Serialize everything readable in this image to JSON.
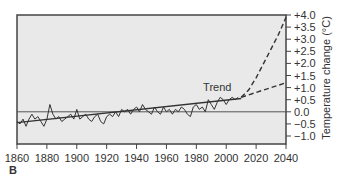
{
  "panel_label": "B",
  "chart_data": {
    "type": "line",
    "title": "",
    "xlabel": "",
    "ylabel": "Temperature change (°C)",
    "xlim": [
      1860,
      2040
    ],
    "ylim": [
      -1.0,
      4.0
    ],
    "x_ticks": [
      "1860",
      "1880",
      "1900",
      "1920",
      "1940",
      "1960",
      "1980",
      "2000",
      "2020",
      "2040"
    ],
    "y_ticks": [
      "+4.0",
      "+3.5",
      "+3.0",
      "+2.5",
      "+2.0",
      "+1.5",
      "+1.0",
      "+0.5",
      "0.0",
      "−0.5",
      "−1.0"
    ],
    "grid": false,
    "reference_line": 0.0,
    "annotations": [
      {
        "text": "Trend",
        "x": 1994,
        "y": 0.85
      }
    ],
    "series": [
      {
        "name": "Observed annual temperature anomaly",
        "style": "solid",
        "x": [
          1860,
          1862,
          1864,
          1866,
          1868,
          1870,
          1872,
          1874,
          1876,
          1878,
          1880,
          1882,
          1884,
          1886,
          1888,
          1890,
          1892,
          1894,
          1896,
          1898,
          1900,
          1902,
          1904,
          1906,
          1908,
          1910,
          1912,
          1914,
          1916,
          1918,
          1920,
          1922,
          1924,
          1926,
          1928,
          1930,
          1932,
          1934,
          1936,
          1938,
          1940,
          1942,
          1944,
          1946,
          1948,
          1950,
          1952,
          1954,
          1956,
          1958,
          1960,
          1962,
          1964,
          1966,
          1968,
          1970,
          1972,
          1974,
          1976,
          1978,
          1980,
          1982,
          1984,
          1986,
          1988,
          1990,
          1992,
          1994,
          1996,
          1998,
          2000,
          2002,
          2004,
          2006,
          2008
        ],
        "values": [
          -0.4,
          -0.5,
          -0.3,
          -0.6,
          -0.3,
          -0.1,
          -0.3,
          -0.2,
          -0.4,
          -0.6,
          -0.3,
          0.3,
          -0.1,
          -0.3,
          -0.2,
          -0.4,
          -0.3,
          -0.2,
          -0.1,
          -0.3,
          0.1,
          -0.3,
          -0.2,
          -0.1,
          -0.3,
          -0.4,
          -0.2,
          -0.1,
          -0.4,
          -0.5,
          -0.2,
          -0.1,
          -0.2,
          0.0,
          -0.2,
          0.1,
          0.0,
          0.1,
          -0.1,
          0.1,
          0.2,
          0.0,
          0.3,
          0.1,
          0.0,
          -0.1,
          0.2,
          0.0,
          -0.1,
          0.2,
          0.0,
          0.1,
          -0.1,
          0.1,
          0.0,
          0.2,
          0.1,
          -0.1,
          -0.2,
          0.2,
          0.3,
          0.1,
          0.2,
          0.0,
          0.5,
          0.3,
          0.1,
          0.4,
          0.6,
          0.5,
          0.3,
          0.5,
          0.6,
          0.5,
          0.6
        ]
      },
      {
        "name": "Trend",
        "style": "solid",
        "x": [
          1860,
          2010
        ],
        "values": [
          -0.45,
          0.55
        ]
      },
      {
        "name": "Projection (high)",
        "style": "dashed",
        "x": [
          2010,
          2015,
          2020,
          2025,
          2030,
          2035,
          2040
        ],
        "values": [
          0.6,
          0.9,
          1.4,
          2.0,
          2.6,
          3.2,
          3.9
        ]
      },
      {
        "name": "Projection (low)",
        "style": "dashed",
        "x": [
          2010,
          2020,
          2030,
          2040
        ],
        "values": [
          0.6,
          0.8,
          1.0,
          1.2
        ]
      }
    ]
  }
}
